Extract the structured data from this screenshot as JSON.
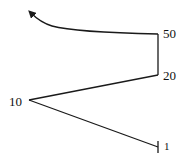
{
  "diagram": {
    "type": "path-with-labeled-vertices",
    "stroke_color": "#1a1a1a",
    "vertices": [
      {
        "label": "1",
        "x": 158,
        "y": 147,
        "label_x": 164,
        "label_y": 151,
        "marker": "tick"
      },
      {
        "label": "10",
        "x": 29,
        "y": 100,
        "label_x": 9,
        "label_y": 106
      },
      {
        "label": "20",
        "x": 158,
        "y": 75,
        "label_x": 163,
        "label_y": 80
      },
      {
        "label": "50",
        "x": 158,
        "y": 34,
        "label_x": 163,
        "label_y": 38
      }
    ],
    "arrow": {
      "direction": "up-left",
      "end_x": 29,
      "end_y": 11
    },
    "labels": {
      "v1": "1",
      "v10": "10",
      "v20": "20",
      "v50": "50"
    }
  }
}
